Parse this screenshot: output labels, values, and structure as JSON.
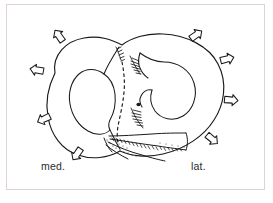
{
  "figure": {
    "kind": "anatomical-line-drawing",
    "background_color": "#ffffff",
    "ink_color": "#1a1a1a",
    "frame_color": "#ded3d6",
    "labels": {
      "medial": "med.",
      "lateral": "lat."
    },
    "annotations": {
      "arrow_count": 8,
      "arrow_meaning": "outward-pointing arrows around the specimen rim",
      "dashed_line_meaning": "dashed outline of hidden border",
      "arrows": [
        {
          "name": "arrow-top-left",
          "cx": 59,
          "cy": 36,
          "rot": -35
        },
        {
          "name": "arrow-top-right",
          "cx": 196,
          "cy": 35,
          "rot": 55
        },
        {
          "name": "arrow-left-upper",
          "cx": 37,
          "cy": 70,
          "rot": -80
        },
        {
          "name": "arrow-right-upper",
          "cx": 227,
          "cy": 59,
          "rot": 75
        },
        {
          "name": "arrow-left-lower",
          "cx": 44,
          "cy": 119,
          "rot": -115
        },
        {
          "name": "arrow-right-lower",
          "cx": 231,
          "cy": 100,
          "rot": 95
        },
        {
          "name": "arrow-bottom-left",
          "cx": 77,
          "cy": 154,
          "rot": -145
        },
        {
          "name": "arrow-bottom-right",
          "cx": 212,
          "cy": 139,
          "rot": 130
        }
      ]
    }
  }
}
